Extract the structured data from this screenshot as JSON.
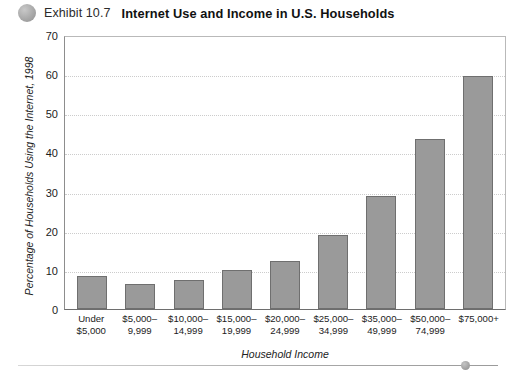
{
  "header": {
    "bullet_icon": "circle-bullet-icon",
    "exhibit_number": "Exhibit 10.7",
    "title": "Internet Use and Income in U.S. Households"
  },
  "footer": {
    "dot_icon": "circle-dot-icon"
  },
  "colors": {
    "bar_fill": "#9a9a9a",
    "bar_border": "#6f6f6f",
    "gridline": "#cccccc",
    "axis": "#6e6e6e",
    "text": "#1c1c1c"
  },
  "chart_data": {
    "type": "bar",
    "title": "Internet Use and Income in U.S. Households",
    "xlabel": "Household Income",
    "ylabel": "Percentage of Households Using the Internet, 1998",
    "ylim": [
      0,
      70
    ],
    "yticks": [
      0,
      10,
      20,
      30,
      40,
      50,
      60,
      70
    ],
    "grid": true,
    "legend": false,
    "categories": [
      "Under\n$5,000",
      "$5,000–\n9,999",
      "$10,000–\n14,999",
      "$15,000–\n19,999",
      "$20,000–\n24,999",
      "$25,000–\n34,999",
      "$35,000–\n49,999",
      "$50,000–\n74,999",
      "$75,000+"
    ],
    "category_lines": [
      [
        "Under",
        "$5,000"
      ],
      [
        "$5,000–",
        "9,999"
      ],
      [
        "$10,000–",
        "14,999"
      ],
      [
        "$15,000–",
        "19,999"
      ],
      [
        "$20,000–",
        "24,999"
      ],
      [
        "$25,000–",
        "34,999"
      ],
      [
        "$35,000–",
        "49,999"
      ],
      [
        "$50,000–",
        "74,999"
      ],
      [
        "$75,000+",
        ""
      ]
    ],
    "values": [
      8.5,
      6.3,
      7.5,
      10.0,
      12.2,
      19.0,
      29.0,
      43.5,
      59.6
    ]
  }
}
